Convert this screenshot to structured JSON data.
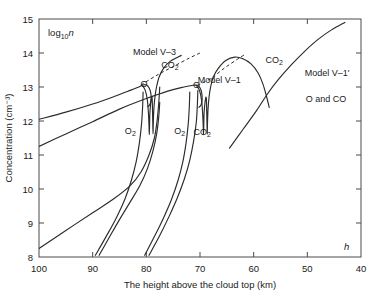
{
  "chart_data": {
    "type": "line",
    "title": "",
    "xlabel": "The height above the cloud top (km)",
    "ylabel": "Concentration (cm⁻³)",
    "y_axis_note": "log₁₀n",
    "x_axis_note": "h",
    "xlim": [
      100,
      40
    ],
    "ylim": [
      8,
      15
    ],
    "x_inverted": true,
    "grid": false,
    "legend": "none",
    "xticks": [
      100,
      90,
      80,
      70,
      60,
      50,
      40
    ],
    "xtick_labels": [
      "100",
      "90",
      "80",
      "70",
      "60",
      "50",
      "40"
    ],
    "yticks": [
      8,
      9,
      10,
      11,
      12,
      13,
      14,
      15
    ],
    "ytick_labels": [
      "8",
      "9",
      "10",
      "11",
      "12",
      "13",
      "14",
      "15"
    ],
    "annotations": [
      {
        "name": "model-v3",
        "text": "Model V–3",
        "x": 82.5,
        "y": 13.93
      },
      {
        "name": "model-v1",
        "text": "Model V–1",
        "x": 70.4,
        "y": 13.12
      },
      {
        "name": "model-v1-prime",
        "text": "Model V–1'",
        "x": 50.5,
        "y": 13.33
      },
      {
        "name": "o-and-co",
        "text": "O and CO",
        "x": 50.3,
        "y": 12.55
      },
      {
        "name": "co2-upper-left",
        "text": "CO₂",
        "x": 77.2,
        "y": 13.55
      },
      {
        "name": "co2-upper-right",
        "text": "CO₂",
        "x": 57.8,
        "y": 13.72
      },
      {
        "name": "o-left",
        "text": "O",
        "x": 81.1,
        "y": 13.0
      },
      {
        "name": "o-right",
        "text": "O",
        "x": 71.3,
        "y": 12.98
      },
      {
        "name": "o2-left",
        "text": "O₂",
        "x": 84.0,
        "y": 11.62
      },
      {
        "name": "o2-right",
        "text": "O₂",
        "x": 74.8,
        "y": 11.63
      },
      {
        "name": "co2-lower",
        "text": "CO₂",
        "x": 71.2,
        "y": 11.58
      }
    ],
    "series": [
      {
        "name": "model-v3-o-upper",
        "label": "O",
        "style": "solid",
        "points": [
          [
            100,
            12.05
          ],
          [
            95,
            12.26
          ],
          [
            90,
            12.5
          ],
          [
            86,
            12.72
          ],
          [
            83,
            12.9
          ],
          [
            81.4,
            13.0
          ],
          [
            80.6,
            13.06
          ],
          [
            80.0,
            13.06
          ],
          [
            79.5,
            12.98
          ],
          [
            79.2,
            12.84
          ],
          [
            79.1,
            12.66
          ],
          [
            79.3,
            12.5
          ],
          [
            79.7,
            12.42
          ]
        ]
      },
      {
        "name": "model-v1-o-upper",
        "label": "O",
        "style": "solid",
        "points": [
          [
            100,
            11.25
          ],
          [
            95,
            11.62
          ],
          [
            90,
            11.98
          ],
          [
            85,
            12.35
          ],
          [
            80,
            12.66
          ],
          [
            76,
            12.88
          ],
          [
            73,
            13.0
          ],
          [
            71.3,
            13.05
          ],
          [
            70.5,
            13.05
          ],
          [
            70.0,
            12.98
          ],
          [
            69.7,
            12.84
          ],
          [
            69.6,
            12.64
          ],
          [
            69.8,
            12.48
          ],
          [
            70.2,
            12.4
          ]
        ]
      },
      {
        "name": "model-v3-co2-spike",
        "label": "CO₂",
        "style": "solid",
        "points": [
          [
            80.8,
            13.06
          ],
          [
            80.2,
            12.9
          ],
          [
            79.8,
            12.6
          ],
          [
            79.6,
            12.2
          ],
          [
            79.5,
            11.85
          ],
          [
            79.45,
            11.6
          ],
          [
            79.4,
            11.85
          ],
          [
            79.35,
            12.2
          ],
          [
            79.2,
            12.5
          ],
          [
            79.0,
            12.7
          ],
          [
            78.9,
            12.62
          ],
          [
            78.85,
            12.3
          ],
          [
            78.8,
            11.95
          ],
          [
            78.75,
            11.62
          ],
          [
            78.7,
            11.95
          ],
          [
            78.6,
            12.35
          ],
          [
            78.4,
            12.7
          ],
          [
            78.1,
            13.0
          ],
          [
            77.6,
            13.3
          ],
          [
            76.8,
            13.55
          ],
          [
            75.5,
            13.76
          ],
          [
            73.5,
            13.93
          ]
        ]
      },
      {
        "name": "model-v1-co2-spike",
        "label": "CO₂",
        "style": "solid",
        "points": [
          [
            70.7,
            13.05
          ],
          [
            70.1,
            12.9
          ],
          [
            69.7,
            12.6
          ],
          [
            69.5,
            12.2
          ],
          [
            69.4,
            11.85
          ],
          [
            69.35,
            11.6
          ],
          [
            69.3,
            11.85
          ],
          [
            69.25,
            12.2
          ],
          [
            69.1,
            12.5
          ],
          [
            68.9,
            12.7
          ],
          [
            68.8,
            12.6
          ],
          [
            68.75,
            12.28
          ],
          [
            68.7,
            11.94
          ],
          [
            68.65,
            11.62
          ],
          [
            68.6,
            11.95
          ],
          [
            68.5,
            12.35
          ],
          [
            68.3,
            12.72
          ],
          [
            68.0,
            13.02
          ],
          [
            67.5,
            13.3
          ],
          [
            66.6,
            13.55
          ],
          [
            65.2,
            13.78
          ],
          [
            63.5,
            13.88
          ],
          [
            62.0,
            13.83
          ],
          [
            60.5,
            13.68
          ],
          [
            59.2,
            13.42
          ],
          [
            58.3,
            13.1
          ],
          [
            57.6,
            12.72
          ],
          [
            57.1,
            12.4
          ]
        ]
      },
      {
        "name": "model-v3-dashed-extension",
        "label": "",
        "style": "dashed",
        "points": [
          [
            81.0,
            13.06
          ],
          [
            78.0,
            13.35
          ],
          [
            75.0,
            13.6
          ],
          [
            72.0,
            13.85
          ],
          [
            70.0,
            14.0
          ]
        ]
      },
      {
        "name": "model-v1-dashed-extension",
        "label": "",
        "style": "dashed",
        "points": [
          [
            70.5,
            13.05
          ],
          [
            68.0,
            13.25
          ],
          [
            65.5,
            13.55
          ],
          [
            63.0,
            13.82
          ],
          [
            61.5,
            13.97
          ]
        ]
      },
      {
        "name": "co2-rising-right",
        "label": "CO₂",
        "style": "solid",
        "points": [
          [
            64.5,
            11.2
          ],
          [
            62.0,
            11.75
          ],
          [
            59.5,
            12.3
          ],
          [
            57.5,
            12.78
          ],
          [
            55.5,
            13.2
          ],
          [
            53.0,
            13.65
          ],
          [
            50.5,
            14.05
          ],
          [
            48.0,
            14.4
          ],
          [
            45.5,
            14.68
          ],
          [
            43.0,
            14.9
          ]
        ]
      },
      {
        "name": "model-v3-o2",
        "label": "O₂",
        "style": "solid",
        "points": [
          [
            100,
            8.25
          ],
          [
            95,
            8.78
          ],
          [
            90,
            9.3
          ],
          [
            86,
            9.72
          ],
          [
            83,
            10.1
          ],
          [
            81,
            10.5
          ],
          [
            79.5,
            11.0
          ],
          [
            78.5,
            11.5
          ],
          [
            78.0,
            12.0
          ],
          [
            77.7,
            12.5
          ],
          [
            77.5,
            13.0
          ]
        ]
      },
      {
        "name": "model-v3-co2-lower",
        "label": "CO₂",
        "style": "solid",
        "points": [
          [
            88.8,
            8.05
          ],
          [
            87,
            8.55
          ],
          [
            85,
            9.1
          ],
          [
            83,
            9.62
          ],
          [
            81.2,
            10.1
          ],
          [
            79.8,
            10.6
          ],
          [
            78.8,
            11.1
          ],
          [
            78.1,
            11.6
          ],
          [
            77.7,
            12.1
          ],
          [
            77.5,
            12.55
          ]
        ]
      },
      {
        "name": "model-v3-o2-second",
        "label": "O₂",
        "style": "solid",
        "points": [
          [
            89.5,
            8.05
          ],
          [
            87.5,
            8.6
          ],
          [
            85.6,
            9.15
          ],
          [
            84.0,
            9.7
          ],
          [
            82.8,
            10.25
          ],
          [
            81.9,
            10.8
          ],
          [
            81.3,
            11.35
          ],
          [
            80.9,
            11.9
          ],
          [
            80.7,
            12.4
          ],
          [
            80.6,
            12.85
          ]
        ]
      },
      {
        "name": "model-v1-o2",
        "label": "O₂",
        "style": "solid",
        "points": [
          [
            80.3,
            8.05
          ],
          [
            78.5,
            8.6
          ],
          [
            76.8,
            9.15
          ],
          [
            75.3,
            9.7
          ],
          [
            74.1,
            10.25
          ],
          [
            73.2,
            10.8
          ],
          [
            72.6,
            11.35
          ],
          [
            72.2,
            11.9
          ],
          [
            72.0,
            12.4
          ],
          [
            71.9,
            12.85
          ]
        ]
      },
      {
        "name": "model-v1-co2-lower",
        "label": "CO₂",
        "style": "solid",
        "points": [
          [
            79.5,
            8.05
          ],
          [
            77.6,
            8.6
          ],
          [
            75.8,
            9.18
          ],
          [
            74.2,
            9.75
          ],
          [
            72.9,
            10.3
          ],
          [
            71.9,
            10.85
          ],
          [
            71.2,
            11.4
          ],
          [
            70.7,
            11.95
          ],
          [
            70.5,
            12.45
          ],
          [
            70.4,
            12.9
          ]
        ]
      }
    ]
  }
}
